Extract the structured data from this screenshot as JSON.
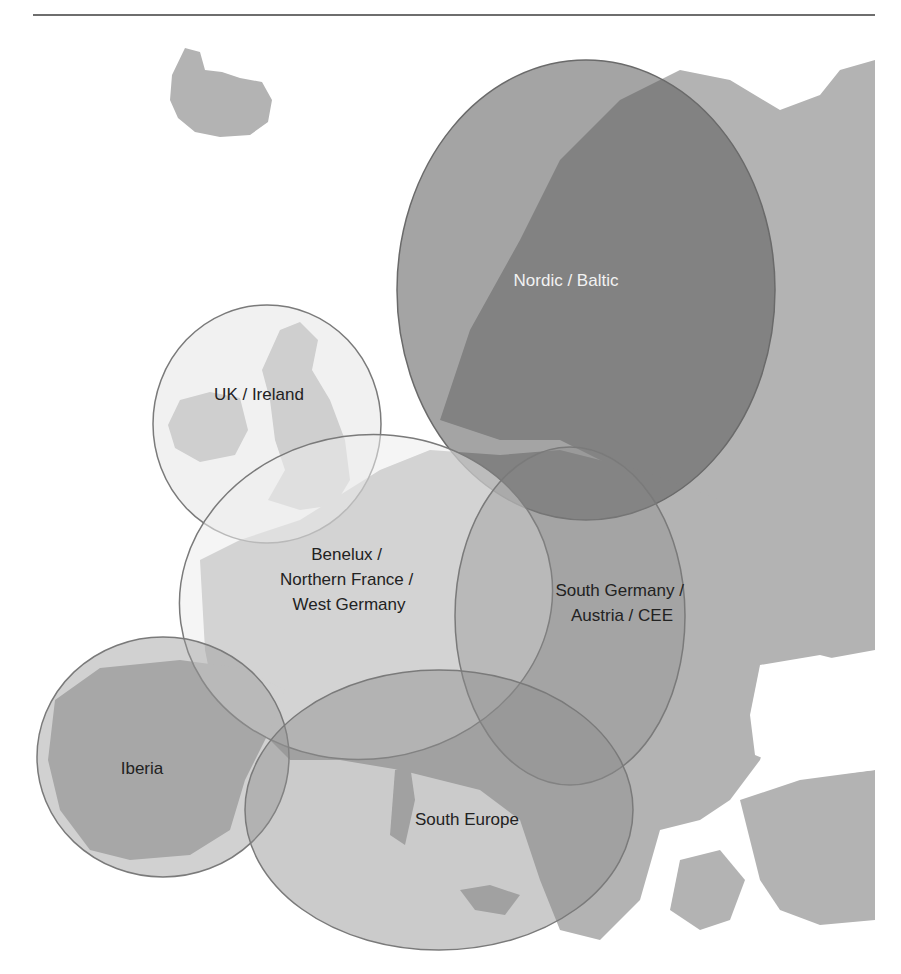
{
  "figure": {
    "type": "map",
    "colors": {
      "land": "#b3b3b3",
      "land_dark": "#9a9a9a",
      "sea": "#ffffff",
      "region_light": "#d9d9d9",
      "region_dark": "#6f6f6f",
      "region_outline": "#7a7a7a",
      "label_dark": "#222222",
      "label_light": "#f2f2f2",
      "rule": "#6e6e6e"
    },
    "regions": [
      {
        "id": "nordic-baltic",
        "label": "Nordic / Baltic",
        "lines": [
          "Nordic / Baltic"
        ],
        "shade": "dark"
      },
      {
        "id": "uk-ireland",
        "label": "UK / Ireland",
        "lines": [
          "UK / Ireland"
        ],
        "shade": "light"
      },
      {
        "id": "benelux",
        "label": "Benelux / Northern France / West Germany",
        "lines": [
          "Benelux /",
          "Northern France /",
          "West Germany"
        ],
        "shade": "light"
      },
      {
        "id": "south-germany",
        "label": "South Germany / Austria / CEE",
        "lines": [
          "South Germany /",
          "Austria / CEE"
        ],
        "shade": "medium"
      },
      {
        "id": "iberia",
        "label": "Iberia",
        "lines": [
          "Iberia"
        ],
        "shade": "medium"
      },
      {
        "id": "south-europe",
        "label": "South Europe",
        "lines": [
          "South Europe"
        ],
        "shade": "medium"
      }
    ]
  }
}
